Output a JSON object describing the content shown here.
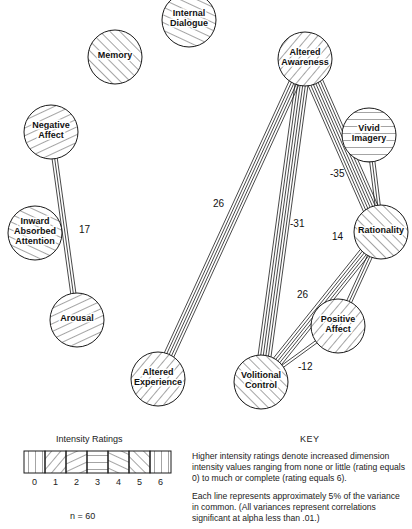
{
  "diagram": {
    "nodes": [
      {
        "id": "internal_dialogue",
        "label_lines": [
          "Internal",
          "Dialogue"
        ],
        "cx": 189,
        "cy": 20,
        "r": 27,
        "rating": 4
      },
      {
        "id": "memory",
        "label_lines": [
          "Memory"
        ],
        "cx": 115,
        "cy": 57,
        "r": 27,
        "rating": 5
      },
      {
        "id": "altered_awareness",
        "label_lines": [
          "Altered",
          "Awareness"
        ],
        "cx": 305,
        "cy": 59,
        "r": 27,
        "rating": 1
      },
      {
        "id": "negative_affect",
        "label_lines": [
          "Negative",
          "Affect"
        ],
        "cx": 51,
        "cy": 132,
        "r": 27,
        "rating": 2
      },
      {
        "id": "vivid_imagery",
        "label_lines": [
          "Vivid",
          "Imagery"
        ],
        "cx": 369,
        "cy": 135,
        "r": 27,
        "rating": 3
      },
      {
        "id": "inward_absorbed_attention",
        "label_lines": [
          "Inward",
          "Absorbed",
          "Attention"
        ],
        "cx": 35,
        "cy": 233,
        "r": 27,
        "rating": 4
      },
      {
        "id": "rationality",
        "label_lines": [
          "Rationality"
        ],
        "cx": 381,
        "cy": 232,
        "r": 27,
        "rating": 5
      },
      {
        "id": "arousal",
        "label_lines": [
          "Arousal"
        ],
        "cx": 77,
        "cy": 320,
        "r": 27,
        "rating": 2
      },
      {
        "id": "positive_affect",
        "label_lines": [
          "Positive",
          "Affect"
        ],
        "cx": 338,
        "cy": 326,
        "r": 27,
        "rating": 1
      },
      {
        "id": "altered_experience",
        "label_lines": [
          "Altered",
          "Experience"
        ],
        "cx": 158,
        "cy": 379,
        "r": 27,
        "rating": 1
      },
      {
        "id": "volitional_control",
        "label_lines": [
          "Volitional",
          "Control"
        ],
        "cx": 261,
        "cy": 382,
        "r": 27,
        "rating": 5
      }
    ],
    "edges": [
      {
        "from": "negative_affect",
        "to": "arousal",
        "value": "17",
        "lines": 3,
        "label_x": 79,
        "label_y": 233
      },
      {
        "from": "altered_awareness",
        "to": "altered_experience",
        "value": "26",
        "lines": 5,
        "label_x": 213,
        "label_y": 207
      },
      {
        "from": "altered_awareness",
        "to": "volitional_control",
        "value": "-31",
        "lines": 6,
        "label_x": 290,
        "label_y": 227
      },
      {
        "from": "altered_awareness",
        "to": "rationality",
        "value": "-35",
        "lines": 7,
        "label_x": 330,
        "label_y": 177
      },
      {
        "from": "vivid_imagery",
        "to": "rationality",
        "value": "",
        "lines": 3,
        "label_x": 0,
        "label_y": 0
      },
      {
        "from": "rationality",
        "to": "volitional_control",
        "value": "26",
        "lines": 5,
        "label_x": 297,
        "label_y": 298
      },
      {
        "from": "rationality",
        "to": "positive_affect",
        "value": "14",
        "lines": 3,
        "label_x": 332,
        "label_y": 240
      },
      {
        "from": "positive_affect",
        "to": "volitional_control",
        "value": "-12",
        "lines": 2,
        "label_x": 298,
        "label_y": 370
      }
    ]
  },
  "legend": {
    "title": "Intensity Ratings",
    "ticks": [
      "0",
      "1",
      "2",
      "3",
      "4",
      "5",
      "6"
    ],
    "n_label": "n = 60"
  },
  "key": {
    "title": "KEY",
    "paragraph1": "Higher intensity ratings denote increased dimension intensity values ranging from none or little (rating equals 0) to much or complete (rating equals 6).",
    "paragraph2": "Each line represents approximately 5% of the variance in common. (All variances represent correlations significant at alpha less than .01.)"
  },
  "colors": {
    "ink": "#1a1a1a",
    "background": "#ffffff"
  }
}
